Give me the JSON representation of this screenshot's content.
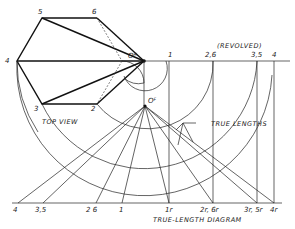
{
  "diagram": {
    "top_view": {
      "label": "TOP VIEW",
      "points": {
        "1": "1",
        "2": "2",
        "3": "3",
        "4": "4",
        "5": "5",
        "6": "6"
      },
      "apex": "O",
      "apex_sup": "H"
    },
    "front_apex": "O",
    "front_apex_sup": "F",
    "revolved_label": "(REVOLVED)",
    "revolved_points": [
      "1",
      "2,6",
      "3,5",
      "4"
    ],
    "true_lengths_label": "TRUE LENGTHS",
    "baseline_left_points": [
      "4",
      "3,5",
      "2 6",
      "1"
    ],
    "baseline_right_points": [
      "1r",
      "2r, 6r",
      "3r, 5r",
      "4r"
    ],
    "title": "TRUE-LENGTH DIAGRAM"
  }
}
